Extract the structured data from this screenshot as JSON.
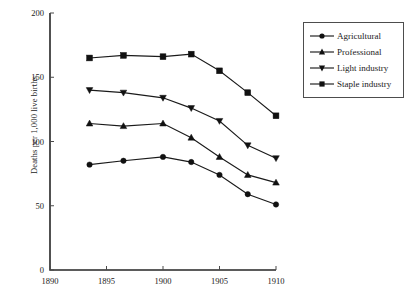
{
  "chart_data": {
    "type": "line",
    "title": "",
    "xlabel": "",
    "ylabel": "Deaths per 1,000 live births",
    "xlim": [
      1890,
      1910
    ],
    "ylim": [
      0,
      200
    ],
    "xticks": [
      1890,
      1895,
      1900,
      1905,
      1910
    ],
    "yticks": [
      0,
      50,
      100,
      150,
      200
    ],
    "grid": false,
    "legend_position": "right",
    "x": [
      1893.5,
      1896.5,
      1900,
      1902.5,
      1905,
      1907.5,
      1910
    ],
    "series": [
      {
        "name": "Agricultural",
        "marker": "circle",
        "values": [
          82,
          85,
          88,
          84,
          74,
          59,
          51
        ]
      },
      {
        "name": "Professional",
        "marker": "triangle-up",
        "values": [
          114,
          112,
          114,
          103,
          88,
          74,
          68
        ]
      },
      {
        "name": "Light industry",
        "marker": "triangle-down",
        "values": [
          140,
          138,
          134,
          126,
          116,
          97,
          87
        ]
      },
      {
        "name": "Staple industry",
        "marker": "square",
        "values": [
          165,
          167,
          166,
          168,
          155,
          138,
          120
        ]
      }
    ]
  },
  "axis": {
    "y_title": "Deaths per 1,000 live births",
    "y_tick_labels": [
      "0",
      "50",
      "100",
      "150",
      "200"
    ],
    "x_tick_labels": [
      "1890",
      "1895",
      "1900",
      "1905",
      "1910"
    ]
  },
  "legend": {
    "items": [
      {
        "label": "Agricultural",
        "marker": "circle"
      },
      {
        "label": "Professional",
        "marker": "triangle-up"
      },
      {
        "label": "Light industry",
        "marker": "triangle-down"
      },
      {
        "label": "Staple industry",
        "marker": "square"
      }
    ]
  },
  "colors": {
    "ink": "#1a1a1a",
    "axis": "#262626",
    "background": "#ffffff"
  }
}
